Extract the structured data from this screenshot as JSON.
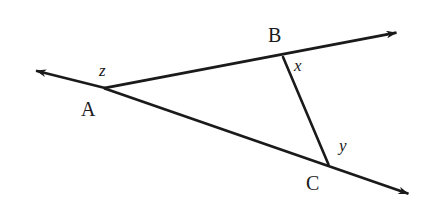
{
  "figure": {
    "type": "geometry-diagram",
    "background_color": "#ffffff",
    "stroke_color": "#1a1a1a",
    "canvas": {
      "width": 434,
      "height": 200
    }
  },
  "points": {
    "A": {
      "label": "A",
      "x": 105,
      "y": 88
    },
    "B": {
      "label": "B",
      "x": 283,
      "y": 57
    },
    "C": {
      "label": "C",
      "x": 328,
      "y": 164
    }
  },
  "angles": {
    "z": {
      "label": "z",
      "at_vertex": "A",
      "x": 105,
      "y": 71
    },
    "x": {
      "label": "x",
      "at_vertex": "B",
      "x": 301,
      "y": 66
    },
    "y": {
      "label": "y",
      "at_vertex": "C",
      "x": 346,
      "y": 146
    }
  },
  "segments": {
    "ray_upper": {
      "name": "ray-through-B",
      "from": {
        "x": 105,
        "y": 88
      },
      "to": {
        "x": 400,
        "y": 32
      },
      "arrow_end": true
    },
    "ray_lower": {
      "name": "ray-through-C",
      "from": {
        "x": 105,
        "y": 88
      },
      "to": {
        "x": 412,
        "y": 195
      },
      "arrow_end": true
    },
    "ray_back": {
      "name": "ray-left-of-A",
      "from": {
        "x": 105,
        "y": 88
      },
      "to": {
        "x": 33,
        "y": 70
      },
      "arrow_end": true
    },
    "transversal": {
      "name": "segment-BC",
      "from": {
        "x": 283,
        "y": 57
      },
      "to": {
        "x": 328,
        "y": 164
      },
      "arrow_end": false
    }
  }
}
